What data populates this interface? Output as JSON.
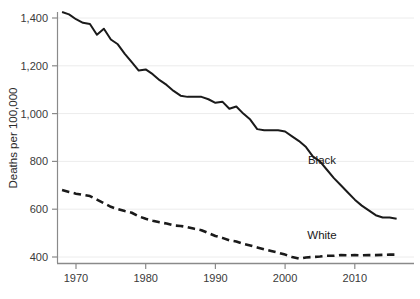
{
  "chart_data": {
    "type": "line",
    "title": "",
    "subtitle": "",
    "xlabel": "",
    "ylabel": "Deaths per 100,000",
    "xlim": [
      1968,
      2016
    ],
    "ylim": [
      340,
      1450
    ],
    "grid": true,
    "grid_orientation": "horizontal",
    "legend_position": "inline-right",
    "yticks": [
      400,
      600,
      800,
      1000,
      1200,
      1400
    ],
    "ytick_labels": [
      "400",
      "600",
      "800",
      "1,000",
      "1,200",
      "1,400"
    ],
    "xticks": [
      1970,
      1980,
      1990,
      2000,
      2010
    ],
    "xtick_labels": [
      "1970",
      "1980",
      "1990",
      "2000",
      "2010"
    ],
    "x": [
      1968,
      1969,
      1970,
      1971,
      1972,
      1973,
      1974,
      1975,
      1976,
      1977,
      1978,
      1979,
      1980,
      1981,
      1982,
      1983,
      1984,
      1985,
      1986,
      1987,
      1988,
      1989,
      1990,
      1991,
      1992,
      1993,
      1994,
      1995,
      1996,
      1997,
      1998,
      1999,
      2000,
      2001,
      2002,
      2003,
      2004,
      2005,
      2006,
      2007,
      2008,
      2009,
      2010,
      2011,
      2012,
      2013,
      2014,
      2015,
      2016
    ],
    "series": [
      {
        "name": "Black",
        "style": "solid",
        "color": "#1a1a1a",
        "label_text": "Black",
        "values": [
          1425,
          1415,
          1395,
          1380,
          1375,
          1330,
          1355,
          1310,
          1290,
          1250,
          1215,
          1180,
          1185,
          1165,
          1140,
          1120,
          1095,
          1075,
          1070,
          1070,
          1070,
          1060,
          1045,
          1050,
          1020,
          1030,
          1000,
          975,
          935,
          930,
          930,
          930,
          925,
          905,
          885,
          860,
          820,
          800,
          765,
          730,
          700,
          670,
          640,
          615,
          595,
          575,
          565,
          565,
          560
        ]
      },
      {
        "name": "White",
        "style": "dashed",
        "color": "#1a1a1a",
        "label_text": "White",
        "values": [
          680,
          672,
          665,
          660,
          655,
          640,
          625,
          610,
          600,
          592,
          585,
          570,
          560,
          552,
          545,
          540,
          532,
          530,
          525,
          518,
          512,
          500,
          488,
          480,
          470,
          465,
          455,
          448,
          440,
          432,
          425,
          418,
          410,
          400,
          393,
          398,
          400,
          402,
          405,
          405,
          408,
          407,
          408,
          407,
          408,
          408,
          409,
          410,
          410
        ]
      }
    ]
  }
}
